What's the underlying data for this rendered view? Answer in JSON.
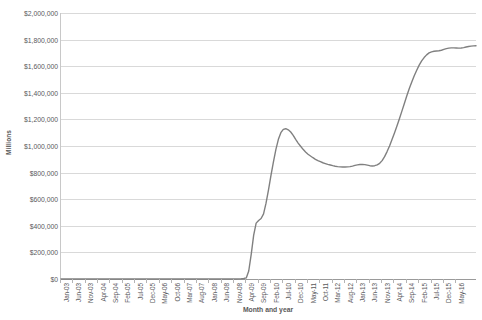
{
  "chart_data": {
    "type": "line",
    "title": "",
    "xlabel": "Month and year",
    "ylabel": "Millions",
    "ylim": [
      0,
      2000000
    ],
    "ytick_values": [
      0,
      200000,
      400000,
      600000,
      800000,
      1000000,
      1200000,
      1400000,
      1600000,
      1800000,
      2000000
    ],
    "ytick_labels": [
      "$0",
      "$200,000",
      "$400,000",
      "$600,000",
      "$800,000",
      "$1,000,000",
      "$1,200,000",
      "$1,400,000",
      "$1,600,000",
      "$1,800,000",
      "$2,000,000"
    ],
    "grid": true,
    "legend": "none",
    "line_color": "#808080",
    "gridline_color": "#d9d9d9",
    "axis_color": "#9a9a9a",
    "tick_label_color": "#59595c",
    "xtick_labels": [
      "Jan-03",
      "Jun-03",
      "Nov-03",
      "Apr-04",
      "Sep-04",
      "Feb-05",
      "Jul-05",
      "Dec-05",
      "May-06",
      "Oct-06",
      "Mar-07",
      "Aug-07",
      "Jan-08",
      "Jun-08",
      "Nov-08",
      "Apr-09",
      "Sep-09",
      "Feb-10",
      "Jul-10",
      "Dec-10",
      "May-11",
      "Oct-11",
      "Mar-12",
      "Aug-12",
      "Jan-13",
      "Jun-13",
      "Nov-13",
      "Apr-14",
      "Sep-14",
      "Feb-15",
      "Jul-15",
      "Dec-15",
      "May-16"
    ],
    "xtick_interval_months": 5,
    "x_start": "Jan-03",
    "x_end": "May-16",
    "x_count": 161,
    "series": [
      {
        "name": "Value",
        "values": [
          0,
          0,
          0,
          0,
          0,
          0,
          0,
          0,
          0,
          0,
          0,
          0,
          0,
          0,
          0,
          0,
          0,
          0,
          0,
          0,
          0,
          0,
          0,
          0,
          0,
          0,
          0,
          0,
          0,
          0,
          0,
          0,
          0,
          0,
          0,
          0,
          0,
          0,
          0,
          0,
          0,
          0,
          0,
          0,
          0,
          0,
          0,
          0,
          0,
          0,
          0,
          0,
          0,
          0,
          0,
          0,
          0,
          0,
          0,
          0,
          0,
          0,
          0,
          0,
          0,
          0,
          0,
          0,
          0,
          0,
          0,
          0,
          1000,
          2000,
          4000,
          8000,
          60000,
          185000,
          330000,
          420000,
          440000,
          455000,
          490000,
          570000,
          670000,
          780000,
          880000,
          975000,
          1050000,
          1100000,
          1125000,
          1130000,
          1122000,
          1105000,
          1080000,
          1050000,
          1022000,
          998000,
          975000,
          955000,
          938000,
          925000,
          912000,
          900000,
          890000,
          882000,
          874000,
          868000,
          862000,
          857000,
          852000,
          848000,
          845000,
          843000,
          842000,
          842000,
          843000,
          845000,
          849000,
          854000,
          858000,
          861000,
          862000,
          860000,
          856000,
          852000,
          850000,
          852000,
          858000,
          870000,
          890000,
          920000,
          958000,
          1000000,
          1048000,
          1098000,
          1150000,
          1205000,
          1262000,
          1320000,
          1378000,
          1432000,
          1482000,
          1528000,
          1570000,
          1608000,
          1640000,
          1665000,
          1685000,
          1700000,
          1708000,
          1712000,
          1714000,
          1716000,
          1720000,
          1726000,
          1732000,
          1736000,
          1738000,
          1738000,
          1737000,
          1736000,
          1737000,
          1740000,
          1744000,
          1748000,
          1751000,
          1753000,
          1754000
        ]
      }
    ]
  }
}
